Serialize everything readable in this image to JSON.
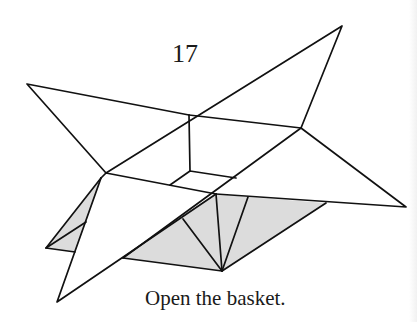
{
  "diagram": {
    "type": "origami-instruction",
    "step_number": "17",
    "caption": "Open the basket.",
    "colors": {
      "line": "#111111",
      "shade": "#dcdcdc",
      "paper": "#ffffff"
    }
  }
}
